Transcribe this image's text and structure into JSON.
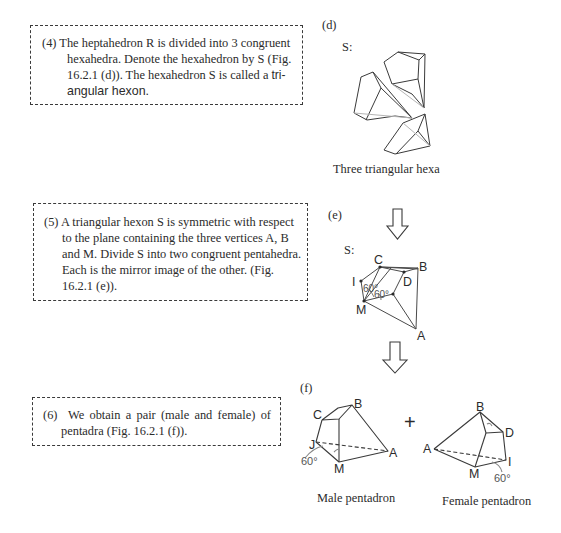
{
  "steps": [
    {
      "number": "(4)",
      "lines": [
        "The heptahedron R is divided into 3 congruent",
        "hexahedra. Denote the hexahedron by S (Fig.",
        "16.2.1 (d)). The hexahedron S is called a ",
        "tri-",
        "angular hexon."
      ]
    },
    {
      "number": "(5)",
      "lines": [
        "A triangular hexon S is symmetric with respect",
        "to the plane containing the three vertices A, B",
        "and M. Divide S into two congruent pentahedra.",
        "Each is the mirror image of the other. (Fig.",
        "16.2.1 (e))."
      ]
    },
    {
      "number": "(6)",
      "lines": [
        "We obtain a pair (male and female) of",
        "pentadra (Fig. 16.2.1 (f))."
      ]
    }
  ],
  "figures": {
    "d": {
      "tag": "(d)",
      "shape_label": "S:",
      "caption": "Three triangular hexa"
    },
    "e": {
      "tag": "(e)",
      "shape_label": "S:",
      "vertices": [
        "C",
        "B",
        "I",
        "D",
        "M",
        "A"
      ],
      "angles": [
        "60°",
        "60°"
      ]
    },
    "f": {
      "tag": "(f)",
      "operator": "+",
      "male": {
        "vertices": [
          "C",
          "B",
          "J",
          "M",
          "A"
        ],
        "angle": "60°",
        "caption": "Male pentadron"
      },
      "female": {
        "vertices": [
          "B",
          "D",
          "A",
          "M",
          "I"
        ],
        "angle": "60°",
        "caption": "Female pentadron"
      }
    }
  },
  "colors": {
    "text": "#2b2b2b",
    "line": "#3a3a3a",
    "hidden_line": "#b5b5b5"
  }
}
